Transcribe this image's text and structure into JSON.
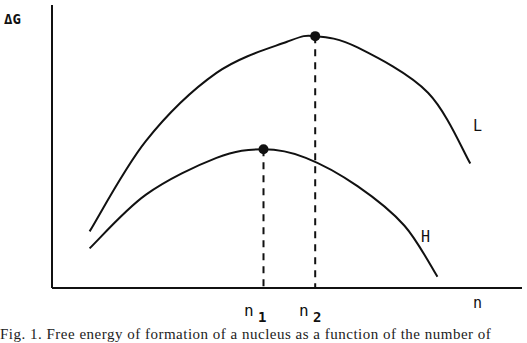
{
  "chart_data": {
    "type": "line",
    "title": "",
    "ylabel": "ΔG",
    "xlabel": "n",
    "x_ticks": [
      "n₁",
      "n₂"
    ],
    "x_ticks_parts": [
      {
        "base": "n",
        "sub": "1"
      },
      {
        "base": "n",
        "sub": "2"
      }
    ],
    "xlim": [
      0,
      10
    ],
    "ylim": [
      0,
      10
    ],
    "series": [
      {
        "name": "L",
        "label": "L",
        "maximum_at": "n₂",
        "points": [
          [
            0.8,
            2.0
          ],
          [
            2.0,
            5.2
          ],
          [
            3.5,
            7.6
          ],
          [
            5.0,
            8.7
          ],
          [
            5.6,
            8.9
          ],
          [
            6.5,
            8.5
          ],
          [
            8.0,
            6.9
          ],
          [
            8.9,
            4.4
          ]
        ]
      },
      {
        "name": "H",
        "label": "H",
        "maximum_at": "n₁",
        "points": [
          [
            0.8,
            1.4
          ],
          [
            2.0,
            3.3
          ],
          [
            3.5,
            4.6
          ],
          [
            4.5,
            4.9
          ],
          [
            5.4,
            4.6
          ],
          [
            6.5,
            3.6
          ],
          [
            7.5,
            2.2
          ],
          [
            8.2,
            0.4
          ]
        ]
      }
    ],
    "markers": [
      {
        "series": "H",
        "x": 4.5,
        "y": 4.9,
        "tick": "n₁"
      },
      {
        "series": "L",
        "x": 5.6,
        "y": 8.9,
        "tick": "n₂"
      }
    ],
    "grid": false,
    "legend": "inline labels at right of curves"
  },
  "caption": "Fig. 1. Free energy of formation of a nucleus as a function of the number of"
}
